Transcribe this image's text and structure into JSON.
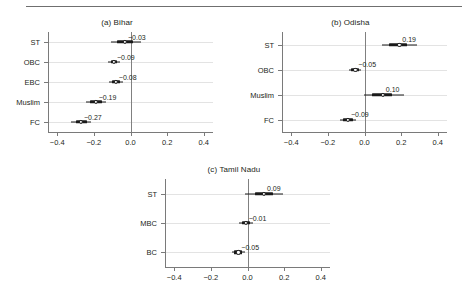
{
  "figure": {
    "panels": [
      {
        "title": "(a) Bihar",
        "categories": [
          "ST",
          "OBC",
          "EBC",
          "Muslim",
          "FC"
        ],
        "values": [
          -0.03,
          -0.09,
          -0.08,
          -0.19,
          -0.27
        ],
        "value_labels": [
          "-0.03",
          "-0.09",
          "-0.08",
          "-0.19",
          "-0.27"
        ],
        "ci_outer_low": [
          -0.105,
          -0.125,
          -0.118,
          -0.245,
          -0.325
        ],
        "ci_outer_high": [
          0.055,
          -0.055,
          -0.042,
          -0.135,
          -0.215
        ],
        "ci_inner_low": [
          -0.075,
          -0.108,
          -0.103,
          -0.222,
          -0.3
        ],
        "ci_inner_high": [
          0.012,
          -0.072,
          -0.058,
          -0.158,
          -0.24
        ],
        "xticks": [
          -0.4,
          -0.2,
          0.0,
          0.2,
          0.4
        ],
        "xtick_labels": [
          "-0.4",
          "-0.2",
          "0.0",
          "0.2",
          "0.4"
        ],
        "xlim": [
          -0.45,
          0.45
        ]
      },
      {
        "title": "(b) Odisha",
        "categories": [
          "ST",
          "OBC",
          "Muslim",
          "FC"
        ],
        "values": [
          0.19,
          -0.05,
          0.1,
          -0.09
        ],
        "value_labels": [
          "0.19",
          "-0.05",
          "0.10",
          "-0.09"
        ],
        "ci_outer_low": [
          0.095,
          -0.082,
          -0.005,
          -0.135
        ],
        "ci_outer_high": [
          0.285,
          -0.018,
          0.215,
          -0.045
        ],
        "ci_inner_low": [
          0.135,
          -0.072,
          0.04,
          -0.118
        ],
        "ci_inner_high": [
          0.232,
          -0.03,
          0.148,
          -0.062
        ],
        "xticks": [
          -0.4,
          -0.2,
          0.0,
          0.2,
          0.4
        ],
        "xtick_labels": [
          "-0.4",
          "-0.2",
          "0.0",
          "0.2",
          "0.4"
        ],
        "xlim": [
          -0.45,
          0.45
        ]
      },
      {
        "title": "(c) Tamil Nadu",
        "categories": [
          "ST",
          "MBC",
          "BC"
        ],
        "values": [
          0.09,
          -0.01,
          -0.05
        ],
        "value_labels": [
          "0.09",
          "-0.01",
          "-0.05"
        ],
        "ci_outer_low": [
          -0.012,
          -0.048,
          -0.085
        ],
        "ci_outer_high": [
          0.196,
          0.03,
          -0.014
        ],
        "ci_inner_low": [
          0.042,
          -0.032,
          -0.072
        ],
        "ci_inner_high": [
          0.138,
          0.012,
          -0.028
        ],
        "xticks": [
          -0.4,
          -0.2,
          0.0,
          0.2,
          0.4
        ],
        "xtick_labels": [
          "-0.4",
          "-0.2",
          "0.0",
          "0.2",
          "0.4"
        ],
        "xlim": [
          -0.45,
          0.45
        ]
      }
    ]
  },
  "chart_data": {
    "type": "scatter",
    "title": "",
    "xlabel": "",
    "ylabel": "",
    "xlim": [
      -0.45,
      0.45
    ],
    "grid": true,
    "legend": "none",
    "panels": [
      {
        "title": "(a) Bihar",
        "categories": [
          "ST",
          "OBC",
          "EBC",
          "Muslim",
          "FC"
        ],
        "values": [
          -0.03,
          -0.09,
          -0.08,
          -0.19,
          -0.27
        ],
        "ci_inner": [
          [
            -0.075,
            0.012
          ],
          [
            -0.108,
            -0.072
          ],
          [
            -0.103,
            -0.058
          ],
          [
            -0.222,
            -0.158
          ],
          [
            -0.3,
            -0.24
          ]
        ],
        "ci_outer": [
          [
            -0.105,
            0.055
          ],
          [
            -0.125,
            -0.055
          ],
          [
            -0.118,
            -0.042
          ],
          [
            -0.245,
            -0.135
          ],
          [
            -0.325,
            -0.215
          ]
        ]
      },
      {
        "title": "(b) Odisha",
        "categories": [
          "ST",
          "OBC",
          "Muslim",
          "FC"
        ],
        "values": [
          0.19,
          -0.05,
          0.1,
          -0.09
        ],
        "ci_inner": [
          [
            0.135,
            0.232
          ],
          [
            -0.072,
            -0.03
          ],
          [
            0.04,
            0.148
          ],
          [
            -0.118,
            -0.062
          ]
        ],
        "ci_outer": [
          [
            0.095,
            0.285
          ],
          [
            -0.082,
            -0.018
          ],
          [
            -0.005,
            0.215
          ],
          [
            -0.135,
            -0.045
          ]
        ]
      },
      {
        "title": "(c) Tamil Nadu",
        "categories": [
          "ST",
          "MBC",
          "BC"
        ],
        "values": [
          0.09,
          -0.01,
          -0.05
        ],
        "ci_inner": [
          [
            0.042,
            0.138
          ],
          [
            -0.032,
            0.012
          ],
          [
            -0.072,
            -0.028
          ]
        ],
        "ci_outer": [
          [
            -0.012,
            0.196
          ],
          [
            -0.048,
            0.03
          ],
          [
            -0.085,
            -0.014
          ]
        ]
      }
    ],
    "xticks": [
      -0.4,
      -0.2,
      0.0,
      0.2,
      0.4
    ],
    "reference_line": 0
  }
}
